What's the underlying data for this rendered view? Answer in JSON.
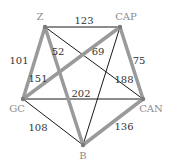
{
  "graph": {
    "nodes": [
      {
        "id": "Z",
        "label": "Z"
      },
      {
        "id": "CAP",
        "label": "CAP"
      },
      {
        "id": "GC",
        "label": "GC"
      },
      {
        "id": "CAN",
        "label": "CAN"
      },
      {
        "id": "B",
        "label": "B"
      }
    ],
    "edges": [
      {
        "from": "Z",
        "to": "CAP",
        "weight": "123",
        "highlighted": false
      },
      {
        "from": "Z",
        "to": "GC",
        "weight": "101",
        "highlighted": true
      },
      {
        "from": "Z",
        "to": "B",
        "weight": "52",
        "highlighted": true
      },
      {
        "from": "Z",
        "to": "CAN",
        "weight": "188",
        "highlighted": false
      },
      {
        "from": "CAP",
        "to": "GC",
        "weight": "151",
        "highlighted": true
      },
      {
        "from": "CAP",
        "to": "B",
        "weight": "69",
        "highlighted": false
      },
      {
        "from": "CAP",
        "to": "CAN",
        "weight": "75",
        "highlighted": true
      },
      {
        "from": "GC",
        "to": "CAN",
        "weight": "202",
        "highlighted": false
      },
      {
        "from": "GC",
        "to": "B",
        "weight": "108",
        "highlighted": false
      },
      {
        "from": "CAN",
        "to": "B",
        "weight": "136",
        "highlighted": true
      }
    ],
    "colors": {
      "highlighted_edge": "#9a9a9a",
      "normal_edge": "#1a1a1a",
      "node": "#7a7a7a"
    }
  }
}
